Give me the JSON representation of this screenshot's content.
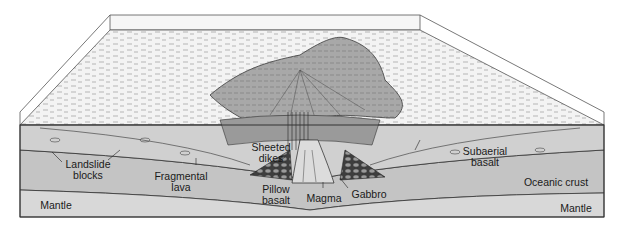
{
  "figure": {
    "colors": {
      "sea_surface": "#eeeeee",
      "volcano_fill": "#a9a9a9",
      "crust": "#c4c4c4",
      "mantle": "#d6d6d6",
      "outline": "#333333",
      "pillow": "#555555"
    },
    "labels": {
      "landslide_blocks": "Landslide\nblocks",
      "fragmental_lava": "Fragmental\nlava",
      "mantle_left": "Mantle",
      "sheeted_dikes": "Sheeted\ndikes",
      "pillow_basalt": "Pillow\nbasalt",
      "magma": "Magma",
      "gabbro": "Gabbro",
      "subaerial_basalt": "Subaerial\nbasalt",
      "oceanic_crust": "Oceanic crust",
      "mantle_right": "Mantle"
    }
  }
}
